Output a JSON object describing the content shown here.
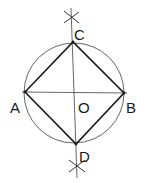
{
  "diagram": {
    "colors": {
      "background": "#ffffff",
      "circle": "#555555",
      "square": "#1a1a1a",
      "axes": "#444444",
      "text": "#1a1a1a"
    },
    "circle": {
      "cx": 74,
      "cy": 93,
      "r": 50
    },
    "points": {
      "A": {
        "label": "A",
        "x": 25,
        "y": 92
      },
      "B": {
        "label": "B",
        "x": 124,
        "y": 93
      },
      "C": {
        "label": "C",
        "x": 73,
        "y": 42
      },
      "D": {
        "label": "D",
        "x": 76,
        "y": 144
      },
      "O": {
        "label": "O",
        "x": 74,
        "y": 93
      }
    },
    "labels": {
      "A": "A",
      "B": "B",
      "C": "C",
      "D": "D",
      "O": "O"
    },
    "construction_marks": {
      "top_cross": {
        "x": 71,
        "y": 17
      },
      "bottom_cross": {
        "x": 77,
        "y": 166
      }
    }
  }
}
